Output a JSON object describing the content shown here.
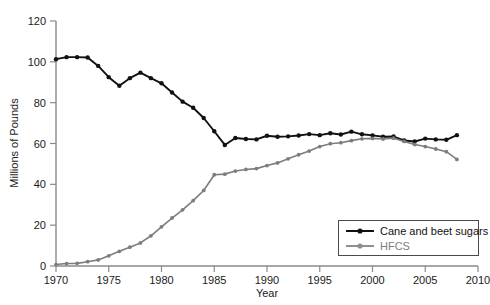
{
  "chart_data": {
    "type": "line",
    "title": "",
    "xlabel": "Year",
    "ylabel": "Millions of Pounds",
    "xlim": [
      1970,
      2010
    ],
    "ylim": [
      0,
      120
    ],
    "xticks": [
      1970,
      1975,
      1980,
      1985,
      1990,
      1995,
      2000,
      2005,
      2010
    ],
    "yticks": [
      0,
      20,
      40,
      60,
      80,
      100,
      120
    ],
    "grid": false,
    "legend_position": "bottom-right",
    "x": [
      1970,
      1971,
      1972,
      1973,
      1974,
      1975,
      1976,
      1977,
      1978,
      1979,
      1980,
      1981,
      1982,
      1983,
      1984,
      1985,
      1986,
      1987,
      1988,
      1989,
      1990,
      1991,
      1992,
      1993,
      1994,
      1995,
      1996,
      1997,
      1998,
      1999,
      2000,
      2001,
      2002,
      2003,
      2004,
      2005,
      2006,
      2007,
      2008
    ],
    "series": [
      {
        "name": "Cane and beet sugars",
        "color": "#111111",
        "marker": "circle",
        "values": [
          101.3,
          102.3,
          102.3,
          102.1,
          98.0,
          92.5,
          88.3,
          92.0,
          94.7,
          92.0,
          89.5,
          85.0,
          80.5,
          77.5,
          72.5,
          66.0,
          59.3,
          62.7,
          62.2,
          62.0,
          63.8,
          63.3,
          63.5,
          63.9,
          64.6,
          64.1,
          65.0,
          64.4,
          65.8,
          64.5,
          64.0,
          63.3,
          63.4,
          61.5,
          61.0,
          62.4,
          62.0,
          61.8,
          64.1
        ]
      },
      {
        "name": "HFCS",
        "color": "#7d7d7d",
        "marker": "circle",
        "values": [
          0.7,
          1.2,
          1.3,
          2.1,
          3.0,
          5.0,
          7.2,
          9.2,
          11.3,
          14.8,
          19.2,
          23.5,
          27.5,
          32.0,
          37.0,
          44.7,
          45.0,
          46.5,
          47.3,
          47.7,
          49.2,
          50.5,
          52.5,
          54.5,
          56.3,
          58.5,
          59.9,
          60.4,
          61.4,
          62.3,
          62.5,
          62.2,
          62.6,
          61.0,
          59.5,
          58.5,
          57.3,
          56.0,
          52.2
        ]
      }
    ]
  },
  "legend": {
    "items": [
      {
        "label": "Cane and beet sugars"
      },
      {
        "label": "HFCS"
      }
    ]
  },
  "axes": {
    "y_title": "Millions of Pounds",
    "x_title": "Year"
  }
}
